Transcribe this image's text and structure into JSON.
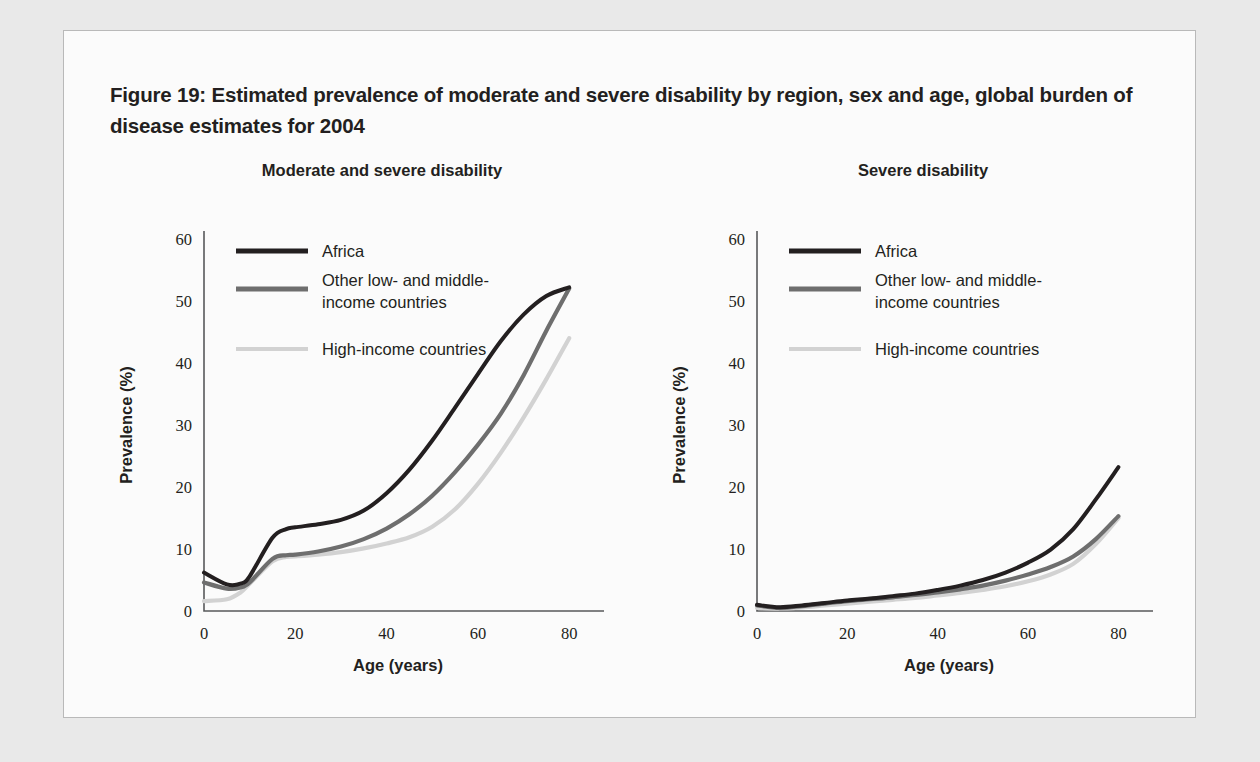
{
  "figure": {
    "title": "Figure 19: Estimated prevalence of moderate and severe disability by region, sex and age, global burden of disease estimates for 2004"
  },
  "colors": {
    "africa": "#231f20",
    "other_low_middle": "#6e6e6e",
    "high_income": "#d2d2d2",
    "axis": "#58595b",
    "text": "#231f20",
    "card_background": "#fbfbfb",
    "page_background": "#e9e9e9",
    "card_border": "#b9b9b9"
  },
  "legend": {
    "items": [
      {
        "label": "Africa",
        "color_key": "africa"
      },
      {
        "label": "Other low- and middle-\nincome countries",
        "label_line1": "Other low- and middle-",
        "label_line2": "income countries",
        "color_key": "other_low_middle"
      },
      {
        "label": "High-income countries",
        "color_key": "high_income"
      }
    ]
  },
  "chart_data": [
    {
      "type": "line",
      "title": "Moderate and severe disability",
      "xlabel": "Age (years)",
      "ylabel": "Prevalence (%)",
      "xlim": [
        0,
        85
      ],
      "ylim": [
        0,
        60
      ],
      "xticks": [
        0,
        20,
        40,
        60,
        80
      ],
      "yticks": [
        0,
        10,
        20,
        30,
        40,
        50,
        60
      ],
      "grid": false,
      "legend_position": "top-left",
      "x": [
        0,
        5,
        8,
        10,
        15,
        18,
        20,
        25,
        30,
        35,
        40,
        45,
        50,
        55,
        60,
        65,
        70,
        75,
        80
      ],
      "series": [
        {
          "name": "Africa",
          "color_key": "africa",
          "values": [
            6.2,
            4.3,
            4.4,
            5.6,
            11.8,
            13.2,
            13.5,
            14.0,
            14.7,
            16.2,
            19.0,
            22.8,
            27.5,
            32.8,
            38.2,
            43.5,
            47.8,
            50.8,
            52.2
          ]
        },
        {
          "name": "Other low- and middle-income countries",
          "color_key": "other_low_middle",
          "values": [
            4.6,
            3.6,
            3.8,
            4.6,
            8.4,
            9.0,
            9.1,
            9.6,
            10.4,
            11.6,
            13.3,
            15.6,
            18.6,
            22.4,
            26.8,
            31.8,
            38.0,
            45.2,
            52.0
          ]
        },
        {
          "name": "High-income countries",
          "color_key": "high_income",
          "values": [
            1.6,
            1.9,
            3.0,
            4.4,
            8.0,
            8.7,
            8.8,
            9.1,
            9.5,
            10.1,
            10.9,
            11.9,
            13.6,
            16.4,
            20.5,
            25.5,
            31.2,
            37.4,
            44.0
          ]
        }
      ]
    },
    {
      "type": "line",
      "title": "Severe disability",
      "xlabel": "Age (years)",
      "ylabel": "Prevalence (%)",
      "xlim": [
        0,
        85
      ],
      "ylim": [
        0,
        60
      ],
      "xticks": [
        0,
        20,
        40,
        60,
        80
      ],
      "yticks": [
        0,
        10,
        20,
        30,
        40,
        50,
        60
      ],
      "grid": false,
      "legend_position": "top-left",
      "x": [
        0,
        5,
        10,
        15,
        20,
        25,
        30,
        35,
        40,
        45,
        50,
        55,
        60,
        65,
        70,
        75,
        80
      ],
      "series": [
        {
          "name": "Africa",
          "color_key": "africa",
          "values": [
            1.0,
            0.6,
            0.9,
            1.3,
            1.7,
            2.0,
            2.4,
            2.8,
            3.4,
            4.1,
            5.0,
            6.2,
            7.8,
            9.9,
            13.2,
            18.0,
            23.2
          ]
        },
        {
          "name": "Other low- and middle-income countries",
          "color_key": "other_low_middle",
          "values": [
            0.9,
            0.5,
            0.8,
            1.2,
            1.6,
            1.9,
            2.2,
            2.6,
            3.0,
            3.5,
            4.1,
            4.9,
            5.9,
            7.1,
            8.8,
            11.6,
            15.3
          ]
        },
        {
          "name": "High-income countries",
          "color_key": "high_income",
          "values": [
            0.5,
            0.4,
            0.6,
            0.9,
            1.2,
            1.5,
            1.8,
            2.1,
            2.5,
            2.9,
            3.4,
            4.0,
            4.8,
            5.9,
            7.6,
            10.8,
            15.0
          ]
        }
      ]
    }
  ]
}
